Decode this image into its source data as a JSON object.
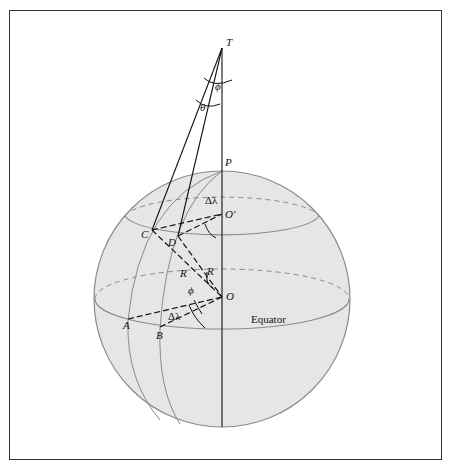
{
  "figure": {
    "points": {
      "T": "T",
      "P": "P",
      "O_prime": "O′",
      "O": "O",
      "C": "C",
      "D": "D",
      "A": "A",
      "B": "B"
    },
    "angles": {
      "phi_top": "ϕ",
      "theta": "θ",
      "phi_center": "ϕ",
      "delta_lambda_top": "Δλ",
      "delta_lambda_bottom": "Δλ"
    },
    "radius_labels": {
      "R1": "R",
      "R2": "R"
    },
    "equator_label": "Equator",
    "colors": {
      "sphere_fill": "#e6e6e6",
      "sphere_stroke": "#8a8a8a",
      "line": "#111111"
    }
  }
}
